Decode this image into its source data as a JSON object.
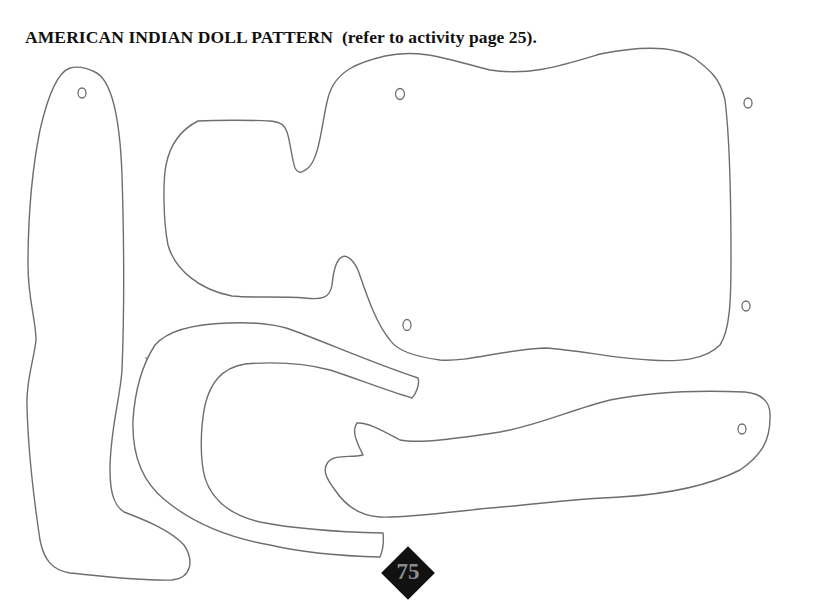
{
  "page": {
    "title": "AMERICAN INDIAN DOLL PATTERN  (refer to activity page 25).",
    "page_number": "75"
  },
  "pattern_pieces": [
    {
      "name": "leg",
      "holes": 1
    },
    {
      "name": "body",
      "holes": 4
    },
    {
      "name": "hair-curve",
      "holes": 0
    },
    {
      "name": "arm",
      "holes": 1
    }
  ],
  "colors": {
    "outline": "#6e6e6e",
    "text": "#111111",
    "badge_fill": "#111111",
    "badge_text": "#8a8a8a"
  }
}
